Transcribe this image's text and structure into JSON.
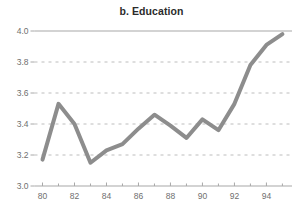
{
  "chart_data": {
    "type": "line",
    "title": "b. Education",
    "xlabel": "",
    "ylabel": "",
    "x": [
      80,
      81,
      82,
      83,
      84,
      85,
      86,
      87,
      88,
      89,
      90,
      91,
      92,
      93,
      94,
      95
    ],
    "values": [
      3.17,
      3.53,
      3.4,
      3.15,
      3.23,
      3.27,
      3.37,
      3.46,
      3.39,
      3.31,
      3.43,
      3.36,
      3.53,
      3.78,
      3.91,
      3.98
    ],
    "series": [
      {
        "name": "Education",
        "values": [
          3.17,
          3.53,
          3.4,
          3.15,
          3.23,
          3.27,
          3.37,
          3.46,
          3.39,
          3.31,
          3.43,
          3.36,
          3.53,
          3.78,
          3.91,
          3.98
        ]
      }
    ],
    "xlim": [
      79.5,
      95.6
    ],
    "ylim": [
      3.0,
      4.0
    ],
    "ytick_values": [
      3.0,
      3.2,
      3.4,
      3.6,
      3.8,
      4.0
    ],
    "ytick_labels": [
      "3.0",
      "3.2",
      "3.4",
      "3.6",
      "3.8",
      "4.0"
    ],
    "xtick_values": [
      80,
      82,
      84,
      86,
      88,
      90,
      92,
      94
    ],
    "xtick_labels": [
      "80",
      "82",
      "84",
      "86",
      "88",
      "90",
      "92",
      "94"
    ],
    "xminor_tick_values": [
      81,
      83,
      85,
      87,
      89,
      91,
      93,
      95
    ],
    "grid": "horizontal-dashed",
    "legend": "none",
    "line_color": "#8d8d8d",
    "grid_color": "#bdbdbd",
    "top_rule_color": "#a8a8a8",
    "axis_color": "#a8a8a8",
    "tick_label_color": "#6f6f6f",
    "title_color": "#2b2b2b",
    "background_color": "#ffffff",
    "line_width": 4
  }
}
